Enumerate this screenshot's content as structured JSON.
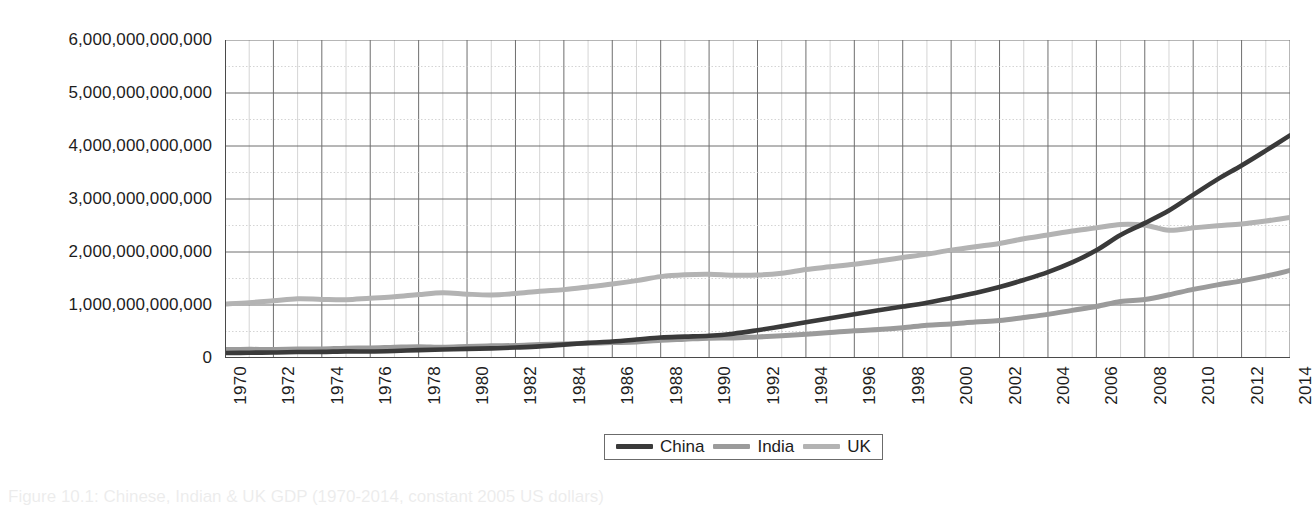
{
  "chart_data": {
    "type": "line",
    "title": "",
    "xlabel": "",
    "ylabel": "",
    "xlim": [
      1970,
      2014
    ],
    "ylim": [
      0,
      6000000000000
    ],
    "grid": true,
    "legend_position": "bottom-center",
    "ytick_labels": [
      "6,000,000,000,000",
      "5,000,000,000,000",
      "4,000,000,000,000",
      "3,000,000,000,000",
      "2,000,000,000,000",
      "1,000,000,000,000",
      "0"
    ],
    "ytick_values": [
      6000000000000,
      5000000000000,
      4000000000000,
      3000000000000,
      2000000000000,
      1000000000000,
      0
    ],
    "xtick_labels": [
      "1970",
      "1972",
      "1974",
      "1976",
      "1978",
      "1980",
      "1982",
      "1984",
      "1986",
      "1988",
      "1990",
      "1992",
      "1994",
      "1996",
      "1998",
      "2000",
      "2002",
      "2004",
      "2006",
      "2008",
      "2010",
      "2012",
      "2014"
    ],
    "x": [
      1970,
      1971,
      1972,
      1973,
      1974,
      1975,
      1976,
      1977,
      1978,
      1979,
      1980,
      1981,
      1982,
      1983,
      1984,
      1985,
      1986,
      1987,
      1988,
      1989,
      1990,
      1991,
      1992,
      1993,
      1994,
      1995,
      1996,
      1997,
      1998,
      1999,
      2000,
      2001,
      2002,
      2003,
      2004,
      2005,
      2006,
      2007,
      2008,
      2009,
      2010,
      2011,
      2012,
      2013,
      2014
    ],
    "series": [
      {
        "name": "China",
        "color": "#3a3a3a",
        "values": [
          93000000000,
          100000000000,
          104000000000,
          112000000000,
          115000000000,
          125000000000,
          123000000000,
          133000000000,
          149000000000,
          160000000000,
          172000000000,
          181000000000,
          198000000000,
          219000000000,
          252000000000,
          286000000000,
          312000000000,
          348000000000,
          387000000000,
          404000000000,
          420000000000,
          459000000000,
          524000000000,
          597000000000,
          675000000000,
          749000000000,
          824000000000,
          900000000000,
          970000000000,
          1044000000000,
          1132000000000,
          1226000000000,
          1338000000000,
          1472000000000,
          1620000000000,
          1803000000000,
          2032000000000,
          2321000000000,
          2545000000000,
          2782000000000,
          3077000000000,
          3370000000000,
          3632000000000,
          3912000000000,
          4200000000000
        ]
      },
      {
        "name": "India",
        "color": "#9b9b9b",
        "values": [
          160000000000,
          163000000000,
          162000000000,
          168000000000,
          170000000000,
          185000000000,
          188000000000,
          202000000000,
          213000000000,
          202000000000,
          216000000000,
          229000000000,
          236000000000,
          254000000000,
          264000000000,
          278000000000,
          291000000000,
          302000000000,
          334000000000,
          354000000000,
          374000000000,
          378000000000,
          398000000000,
          418000000000,
          446000000000,
          479000000000,
          515000000000,
          536000000000,
          570000000000,
          618000000000,
          643000000000,
          679000000000,
          706000000000,
          763000000000,
          823000000000,
          899000000000,
          972000000000,
          1068000000000,
          1103000000000,
          1192000000000,
          1294000000000,
          1380000000000,
          1455000000000,
          1545000000000,
          1650000000000
        ]
      },
      {
        "name": "UK",
        "color": "#b3b3b3",
        "values": [
          1020000000000,
          1045000000000,
          1080000000000,
          1118000000000,
          1105000000000,
          1098000000000,
          1128000000000,
          1155000000000,
          1196000000000,
          1230000000000,
          1205000000000,
          1190000000000,
          1215000000000,
          1260000000000,
          1290000000000,
          1340000000000,
          1395000000000,
          1460000000000,
          1535000000000,
          1570000000000,
          1580000000000,
          1562000000000,
          1565000000000,
          1600000000000,
          1670000000000,
          1720000000000,
          1770000000000,
          1830000000000,
          1895000000000,
          1960000000000,
          2035000000000,
          2100000000000,
          2160000000000,
          2250000000000,
          2320000000000,
          2395000000000,
          2455000000000,
          2520000000000,
          2505000000000,
          2410000000000,
          2455000000000,
          2495000000000,
          2530000000000,
          2585000000000,
          2650000000000
        ]
      }
    ]
  },
  "legend": {
    "entries": [
      {
        "label": "China",
        "color": "#3a3a3a"
      },
      {
        "label": "India",
        "color": "#9b9b9b"
      },
      {
        "label": "UK",
        "color": "#b3b3b3"
      }
    ]
  },
  "caption": {
    "text": "Figure 10.1: Chinese, Indian & UK GDP (1970-2014, constant 2005 US dollars)"
  },
  "colors": {
    "axis": "#4a4a4a",
    "grid_major": "#6e6e6e",
    "grid_minor": "#c9c9c9",
    "text": "#1d1d1d"
  }
}
